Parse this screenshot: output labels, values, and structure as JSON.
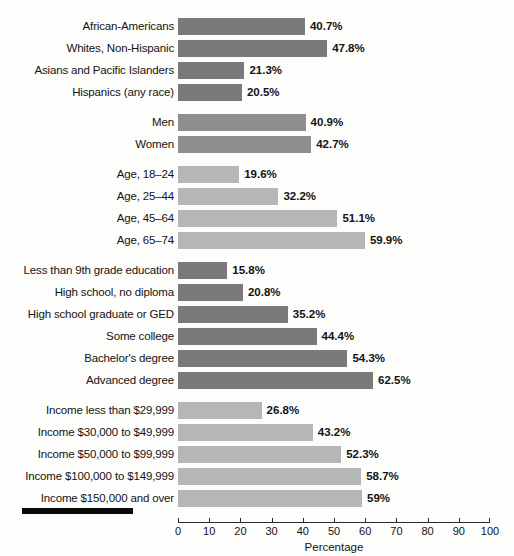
{
  "chart_data": {
    "type": "bar",
    "orientation": "horizontal",
    "title": "",
    "xlabel": "Percentage",
    "ylabel": "",
    "xlim": [
      0,
      100
    ],
    "xticks": [
      0,
      10,
      20,
      30,
      40,
      50,
      60,
      70,
      80,
      90,
      100
    ],
    "xtick_labels": [
      "0",
      "10",
      "20",
      "30",
      "40",
      "50",
      "60",
      "70",
      "80",
      "90",
      "100"
    ],
    "grid": false,
    "legend": "none",
    "value_label_suffix": "%",
    "colors": {
      "dark": "#7a7a7a",
      "mid": "#8e8e8e",
      "light": "#b6b6b6",
      "axis": "#2a2a2a",
      "text": "#131313",
      "background": "#fdfdfc",
      "footer_rule": "#0a0a0a"
    },
    "groups": [
      {
        "name": "race-ethnicity",
        "shade": "dark",
        "categories": [
          "African-Americans",
          "Whites, Non-Hispanic",
          "Asians and Pacific Islanders",
          "Hispanics (any race)"
        ],
        "values": [
          40.7,
          47.8,
          21.3,
          20.5
        ],
        "value_labels": [
          "40.7%",
          "47.8%",
          "21.3%",
          "20.5%"
        ]
      },
      {
        "name": "gender",
        "shade": "mid",
        "categories": [
          "Men",
          "Women"
        ],
        "values": [
          40.9,
          42.7
        ],
        "value_labels": [
          "40.9%",
          "42.7%"
        ]
      },
      {
        "name": "age",
        "shade": "light",
        "categories": [
          "Age, 18–24",
          "Age, 25–44",
          "Age, 45–64",
          "Age, 65–74"
        ],
        "values": [
          19.6,
          32.2,
          51.1,
          59.9
        ],
        "value_labels": [
          "19.6%",
          "32.2%",
          "51.1%",
          "59.9%"
        ]
      },
      {
        "name": "education",
        "shade": "dark",
        "categories": [
          "Less than 9th grade education",
          "High school, no diploma",
          "High school graduate or GED",
          "Some college",
          "Bachelor's degree",
          "Advanced degree"
        ],
        "values": [
          15.8,
          20.8,
          35.2,
          44.4,
          54.3,
          62.5
        ],
        "value_labels": [
          "15.8%",
          "20.8%",
          "35.2%",
          "44.4%",
          "54.3%",
          "62.5%"
        ]
      },
      {
        "name": "income",
        "shade": "light",
        "categories": [
          "Income less than $29,999",
          "Income $30,000 to $49,999",
          "Income $50,000 to $99,999",
          "Income $100,000 to $149,999",
          "Income $150,000 and over"
        ],
        "values": [
          26.8,
          43.2,
          52.3,
          58.7,
          59.0
        ],
        "value_labels": [
          "26.8%",
          "43.2%",
          "52.3%",
          "58.7%",
          "59%"
        ]
      }
    ]
  }
}
